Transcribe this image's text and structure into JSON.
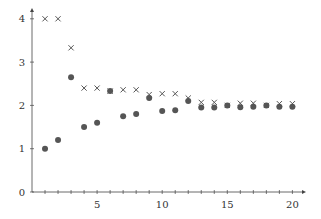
{
  "chart_data": {
    "type": "scatter",
    "title": "",
    "xlabel": "",
    "ylabel": "",
    "xlim": [
      0,
      21
    ],
    "ylim": [
      0,
      4.3
    ],
    "grid": false,
    "legend": null,
    "x_ticks": [
      5,
      10,
      15,
      20
    ],
    "x_minor_ticks": [
      1,
      2,
      3,
      4,
      5,
      6,
      7,
      8,
      9,
      10,
      11,
      12,
      13,
      14,
      15,
      16,
      17,
      18,
      19,
      20
    ],
    "y_ticks": [
      0,
      1,
      2,
      3,
      4
    ],
    "x_tick_labels": [
      "5",
      "10",
      "15",
      "20"
    ],
    "y_tick_labels": [
      "0",
      "1",
      "2",
      "3",
      "4"
    ],
    "series": [
      {
        "name": "upper",
        "marker": "x",
        "color": "#555555",
        "x": [
          1,
          2,
          3,
          4,
          5,
          6,
          7,
          8,
          9,
          10,
          11,
          12,
          13,
          14,
          15,
          16,
          17,
          18,
          19,
          20
        ],
        "values": [
          4.0,
          4.0,
          3.33,
          2.4,
          2.4,
          2.33,
          2.36,
          2.36,
          2.25,
          2.27,
          2.27,
          2.17,
          2.07,
          2.07,
          2.0,
          2.05,
          2.05,
          2.0,
          2.04,
          2.04
        ]
      },
      {
        "name": "lower",
        "marker": "o",
        "color": "#555555",
        "x": [
          1,
          2,
          3,
          4,
          5,
          6,
          7,
          8,
          9,
          10,
          11,
          12,
          13,
          14,
          15,
          16,
          17,
          18,
          19,
          20
        ],
        "values": [
          1.0,
          1.2,
          2.65,
          1.5,
          1.6,
          2.33,
          1.75,
          1.8,
          2.17,
          1.87,
          1.89,
          2.1,
          1.95,
          1.95,
          2.0,
          1.96,
          1.97,
          2.0,
          1.97,
          1.97
        ]
      }
    ]
  },
  "axis": {
    "x_axis_labels": [
      "5",
      "10",
      "15",
      "20"
    ],
    "y_axis_labels": [
      "0",
      "1",
      "2",
      "3",
      "4"
    ]
  }
}
